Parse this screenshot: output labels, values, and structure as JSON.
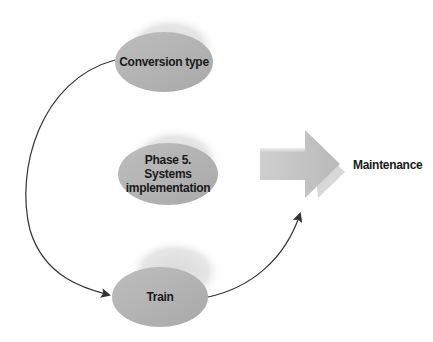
{
  "diagram": {
    "nodes": [
      {
        "id": "conversion",
        "label": "Conversion type"
      },
      {
        "id": "phase",
        "label_lines": [
          "Phase 5.",
          "Systems",
          "implementation"
        ]
      },
      {
        "id": "train",
        "label": "Train"
      }
    ],
    "outcome": {
      "label": "Maintenance"
    },
    "colors": {
      "node_fill": "#b4b4b4",
      "node_shadow": "#dcdcdc",
      "arrow_fill": "#c4c4c4",
      "connector": "#333333",
      "text": "#1a1a1a"
    }
  }
}
